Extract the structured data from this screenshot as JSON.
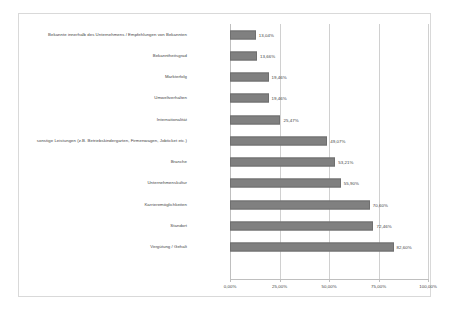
{
  "chart_data": {
    "type": "bar",
    "orientation": "horizontal",
    "title": "",
    "subtitle": "",
    "xlabel": "",
    "ylabel": "",
    "xlim": [
      0,
      100
    ],
    "grid": true,
    "legend": false,
    "bar_color": "#808080",
    "xticks": [
      "0,00%",
      "25,00%",
      "50,00%",
      "75,00%",
      "100,00%"
    ],
    "xtick_values": [
      0,
      25,
      50,
      75,
      100
    ],
    "categories": [
      "Bekannte innerhalb des Unternehmens / Empfehlungen von Bekannten",
      "Bekanntheitsgrad",
      "Markterfolg",
      "Umweltverhalten",
      "Internationalität",
      "sonstige Leistungen (z.B. Betriebskindergarten, Firmenwagen, Jobticket etc.)",
      "Branche",
      "Unternehmenskultur",
      "Karrieremöglichkeiten",
      "Standort",
      "Vergütung / Gehalt"
    ],
    "values": [
      13.04,
      13.66,
      19.46,
      19.46,
      25.47,
      49.07,
      53.21,
      55.9,
      70.6,
      72.46,
      82.6
    ],
    "value_labels": [
      "13,04%",
      "13,66%",
      "19,46%",
      "19,46%",
      "25,47%",
      "49,07%",
      "53,21%",
      "55,90%",
      "70,60%",
      "72,46%",
      "82,60%"
    ]
  }
}
